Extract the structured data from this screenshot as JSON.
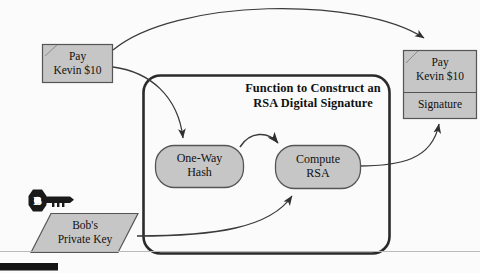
{
  "diagram": {
    "title_line1": "Function to Construct an",
    "title_line2": "RSA Digital Signature",
    "colors": {
      "shape_fill": "#c6c6c6",
      "shape_stroke": "#555555",
      "box_stroke": "#2b2b2b",
      "arrow": "#3a3a3a",
      "key_fill": "#1a1a1a",
      "background": "#fbfbfb",
      "footer_bar": "#141414"
    },
    "nodes": {
      "plaintext_message": {
        "line1": "Pay",
        "line2": "Kevin $10",
        "shape": "document-rectangle"
      },
      "signed_message": {
        "line1": "Pay",
        "line2": "Kevin $10",
        "signature_label": "Signature",
        "shape": "document-rectangle-split"
      },
      "one_way_hash": {
        "line1": "One-Way",
        "line2": "Hash",
        "shape": "rounded-process"
      },
      "compute_rsa": {
        "line1": "Compute",
        "line2": "RSA",
        "shape": "rounded-process"
      },
      "private_key": {
        "line1": "Bob's",
        "line2": "Private Key",
        "key_letter": "B",
        "shape": "parallelogram"
      }
    },
    "edges": [
      {
        "name": "message-to-signed-message",
        "from": "plaintext_message",
        "to": "signed_message",
        "style": "curved-arc-over-top"
      },
      {
        "name": "message-to-hash",
        "from": "plaintext_message",
        "to": "one_way_hash",
        "style": "curved-down"
      },
      {
        "name": "hash-to-rsa",
        "from": "one_way_hash",
        "to": "compute_rsa",
        "style": "short-arc"
      },
      {
        "name": "private-key-to-rsa",
        "from": "private_key",
        "to": "compute_rsa",
        "style": "curved-up-right"
      },
      {
        "name": "rsa-to-signature",
        "from": "compute_rsa",
        "to": "signed_message",
        "style": "curved-up-right"
      }
    ]
  }
}
